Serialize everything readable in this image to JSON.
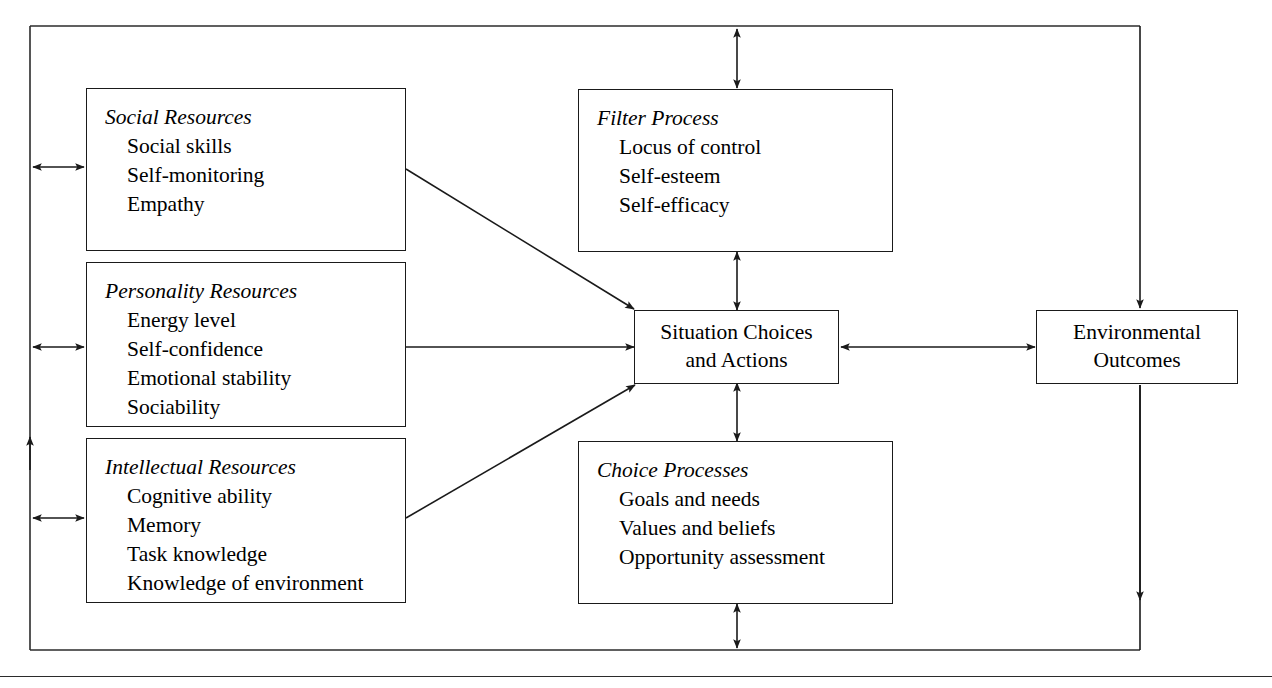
{
  "diagram": {
    "type": "flow-diagram",
    "nodes": [
      {
        "id": "social-resources",
        "title": "Social Resources",
        "items": [
          "Social skills",
          "Self-monitoring",
          "Empathy"
        ]
      },
      {
        "id": "personality-resources",
        "title": "Personality Resources",
        "items": [
          "Energy level",
          "Self-confidence",
          "Emotional stability",
          "Sociability"
        ]
      },
      {
        "id": "intellectual-resources",
        "title": "Intellectual Resources",
        "items": [
          "Cognitive ability",
          "Memory",
          "Task knowledge",
          "Knowledge of environment"
        ]
      },
      {
        "id": "filter-process",
        "title": "Filter Process",
        "items": [
          "Locus of control",
          "Self-esteem",
          "Self-efficacy"
        ]
      },
      {
        "id": "choice-processes",
        "title": "Choice Processes",
        "items": [
          "Goals and needs",
          "Values and beliefs",
          "Opportunity assessment"
        ]
      },
      {
        "id": "situation-choices",
        "label_line1": "Situation Choices",
        "label_line2": "and Actions"
      },
      {
        "id": "environmental-outcomes",
        "label_line1": "Environmental",
        "label_line2": "Outcomes"
      }
    ],
    "colors": {
      "stroke": "#1a1a1a",
      "background": "#ffffff",
      "text": "#000000"
    }
  }
}
